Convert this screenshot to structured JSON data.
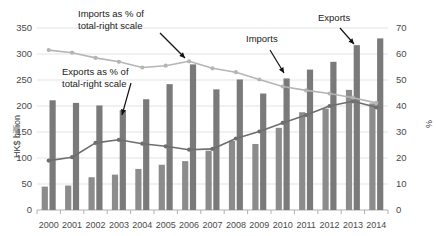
{
  "chart_data": {
    "type": "bar",
    "title": "",
    "subtitle": "",
    "categories": [
      "2000",
      "2001",
      "2002",
      "2003",
      "2004",
      "2005",
      "2006",
      "2007",
      "2008",
      "2009",
      "2010",
      "2011",
      "2012",
      "2013",
      "2014"
    ],
    "xlabel": "",
    "ylabel": "HK$ billion",
    "ylabel_right": "%",
    "ylim": [
      0,
      350
    ],
    "ylim_right": [
      0,
      70
    ],
    "yticks": [
      0,
      50,
      100,
      150,
      200,
      250,
      300,
      350
    ],
    "yticks_right": [
      0,
      10,
      20,
      30,
      40,
      50,
      60,
      70
    ],
    "grid": true,
    "legend_position": "annotations",
    "series": [
      {
        "name": "Exports",
        "type": "bar",
        "axis": "left",
        "color": "#8c8c8c",
        "values": [
          45,
          47,
          63,
          68,
          79,
          87,
          94,
          114,
          133,
          127,
          158,
          188,
          195,
          231,
          205
        ]
      },
      {
        "name": "Imports",
        "type": "bar",
        "axis": "left",
        "color": "#7a7a7a",
        "values": [
          211,
          206,
          201,
          192,
          213,
          242,
          280,
          232,
          251,
          224,
          253,
          270,
          285,
          317,
          330
        ]
      },
      {
        "name": "Imports as % of total-right scale",
        "type": "line",
        "axis": "right",
        "color": "#b5b5b5",
        "values": [
          61.5,
          60.5,
          58.5,
          57.0,
          54.8,
          55.5,
          57.2,
          54.5,
          53.0,
          50.2,
          47.5,
          46.0,
          44.8,
          43.2,
          41.2
        ]
      },
      {
        "name": "Exports as % of total-right scale",
        "type": "line",
        "axis": "right",
        "color": "#6e6e6e",
        "values": [
          19.0,
          20.3,
          25.8,
          27.0,
          25.5,
          24.5,
          23.2,
          23.5,
          27.5,
          30.2,
          33.5,
          36.5,
          40.0,
          41.8,
          39.5
        ]
      }
    ],
    "annotations": [
      {
        "name": "imports-pct-annotation",
        "text_line1": "Imports as % of",
        "text_line2": "total-right scale"
      },
      {
        "name": "exports-pct-annotation",
        "text_line1": "Exports as % of",
        "text_line2": "total-right scale"
      },
      {
        "name": "imports-bar-annotation",
        "text_line1": "Imports",
        "text_line2": ""
      },
      {
        "name": "exports-bar-annotation",
        "text_line1": "Exports",
        "text_line2": ""
      }
    ],
    "colors": {
      "bar_exports": "#8c8c8c",
      "bar_imports": "#7a7a7a",
      "line_imports_pct": "#b5b5b5",
      "line_exports_pct": "#6e6e6e",
      "grid": "#e3e3e3",
      "axis": "#b0b0b0",
      "text": "#3a3a3a"
    }
  }
}
